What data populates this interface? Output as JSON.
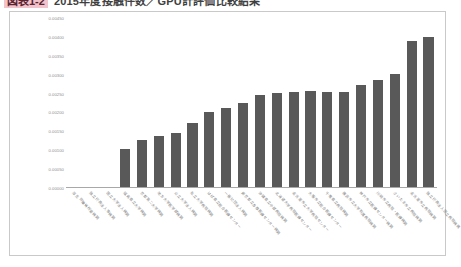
{
  "title": {
    "badge": "図表1-2",
    "text": "2015年度接触件数／GPU計評価比較結果",
    "cropped": true
  },
  "chart_data": {
    "type": "bar",
    "title": "2015年度接触件数／GPU計評価比較結果",
    "xlabel": "",
    "ylabel": "",
    "ylim": [
      0,
      0.0045
    ],
    "grid": false,
    "legend": false,
    "bar_color": "#595959",
    "yticks": [
      "0.00000",
      "0.00050",
      "0.00100",
      "0.00150",
      "0.00200",
      "0.00250",
      "0.00300",
      "0.00350",
      "0.00400",
      "0.00450"
    ],
    "categories": [
      "厚生 労働省所管機関",
      "独立行政法人等機関",
      "国立大学法人機関",
      "福島県立大学機関",
      "京都第二大学機関",
      "地方大学医学部機関",
      "公立大学法人機関",
      "私立大学病院機関",
      "はば県立総合医療センター",
      "一般社団法人機関",
      "東京都立多摩医療センター機関",
      "沖縄県立中部病院機関",
      "北海道大学病院医療センター",
      "名古屋市立大学病院センター",
      "大阪市立総合医療センター",
      "千葉県立病院機関",
      "横浜市立大学附属病院機関",
      "神戸市立医療センター機関",
      "川崎市立病院・医療機関",
      "さいたま市立病院機関",
      "名古屋市立病院機関",
      "独立行政法人国立病院機構"
    ],
    "values": [
      0.0,
      0.0,
      0.0,
      0.001,
      0.00125,
      0.00135,
      0.00145,
      0.0017,
      0.002,
      0.0021,
      0.00225,
      0.00245,
      0.0025,
      0.00252,
      0.00255,
      0.00253,
      0.00253,
      0.00272,
      0.00285,
      0.003,
      0.0039,
      0.004
    ]
  }
}
